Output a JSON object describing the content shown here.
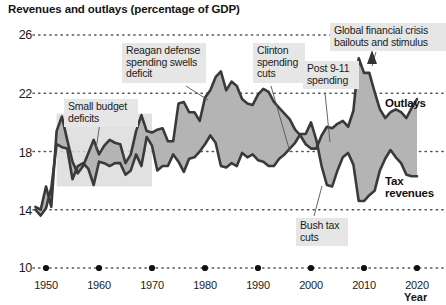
{
  "chart_data": {
    "type": "area",
    "title": "Revenues and outlays (percentage of GDP)",
    "xlabel": "Year",
    "ylabel": "",
    "xlim": [
      1948,
      2021
    ],
    "ylim": [
      10,
      26
    ],
    "grid": true,
    "grid_style": "dotted-horizontal",
    "legend": "inline-right",
    "yticks": [
      "26",
      "22",
      "18",
      "14",
      "10"
    ],
    "ytick_values": [
      26,
      22,
      18,
      14,
      10
    ],
    "xticks": [
      "1950",
      "1960",
      "1970",
      "1980",
      "1990",
      "2000",
      "2010",
      "2020"
    ],
    "xtick_values": [
      1950,
      1960,
      1970,
      1980,
      1990,
      2000,
      2010,
      2020
    ],
    "x": [
      1948,
      1949,
      1950,
      1951,
      1952,
      1953,
      1954,
      1955,
      1956,
      1957,
      1958,
      1959,
      1960,
      1961,
      1962,
      1963,
      1964,
      1965,
      1966,
      1967,
      1968,
      1969,
      1970,
      1971,
      1972,
      1973,
      1974,
      1975,
      1976,
      1977,
      1978,
      1979,
      1980,
      1981,
      1982,
      1983,
      1984,
      1985,
      1986,
      1987,
      1988,
      1989,
      1990,
      1991,
      1992,
      1993,
      1994,
      1995,
      1996,
      1997,
      1998,
      1999,
      2000,
      2001,
      2002,
      2003,
      2004,
      2005,
      2006,
      2007,
      2008,
      2009,
      2010,
      2011,
      2012,
      2013,
      2014,
      2015,
      2016,
      2017,
      2018,
      2019,
      2020
    ],
    "series": [
      {
        "name": "Outlays",
        "color": "#3a3a3a",
        "values": [
          14.2,
          14.0,
          15.6,
          14.2,
          19.4,
          20.4,
          18.8,
          17.3,
          16.5,
          17.0,
          17.9,
          18.8,
          17.8,
          18.4,
          18.8,
          18.6,
          18.5,
          17.2,
          17.8,
          19.4,
          20.5,
          19.4,
          19.3,
          19.5,
          19.6,
          18.7,
          18.7,
          21.3,
          21.4,
          20.7,
          20.7,
          20.1,
          21.7,
          22.2,
          23.1,
          23.5,
          22.2,
          22.8,
          22.5,
          21.6,
          21.3,
          21.2,
          21.9,
          22.3,
          22.1,
          21.4,
          21.0,
          20.6,
          20.2,
          19.5,
          19.1,
          18.5,
          18.2,
          18.2,
          19.1,
          19.7,
          19.6,
          19.9,
          20.1,
          19.7,
          20.8,
          24.4,
          23.4,
          23.4,
          22.1,
          20.9,
          20.3,
          20.7,
          20.9,
          20.7,
          20.3,
          21.0,
          21.6
        ]
      },
      {
        "name": "Tax revenues",
        "color": "#3a3a3a",
        "values": [
          14.0,
          13.6,
          14.1,
          15.5,
          18.5,
          18.3,
          18.2,
          16.1,
          17.0,
          17.2,
          16.8,
          15.7,
          17.3,
          17.2,
          17.0,
          17.2,
          17.2,
          16.4,
          16.7,
          17.8,
          17.0,
          19.0,
          18.4,
          16.7,
          17.0,
          17.0,
          17.8,
          17.3,
          16.6,
          17.5,
          17.6,
          18.0,
          18.5,
          19.1,
          18.6,
          17.0,
          16.9,
          17.2,
          17.0,
          17.9,
          17.6,
          17.8,
          17.4,
          17.3,
          17.0,
          17.0,
          17.5,
          17.8,
          18.2,
          18.6,
          19.2,
          19.2,
          20.0,
          18.8,
          17.0,
          15.7,
          15.6,
          16.7,
          17.6,
          17.9,
          17.1,
          14.6,
          14.6,
          15.0,
          15.3,
          16.7,
          17.5,
          18.1,
          17.6,
          17.2,
          16.4,
          16.3,
          16.3
        ]
      }
    ],
    "annotations": [
      {
        "id": "small-budget-deficits",
        "text_lines": [
          "Small budget",
          "deficits"
        ],
        "points_to_year": 1964,
        "points_to_value": 18.2
      },
      {
        "id": "reagan-defense",
        "text_lines": [
          "Reagan defense",
          "spending swells",
          "deficit"
        ],
        "points_to_year": 1983,
        "points_to_value": 23.5
      },
      {
        "id": "clinton-spending-cuts",
        "text_lines": [
          "Clinton",
          "spending",
          "cuts"
        ],
        "points_to_year": 1999,
        "points_to_value": 18.5
      },
      {
        "id": "post-911-spending",
        "text_lines": [
          "Post 9-11",
          "spending"
        ],
        "points_to_year": 2004,
        "points_to_value": 19.6
      },
      {
        "id": "global-financial-crisis",
        "text_lines": [
          "Global financial crisis",
          "bailouts and stimulus"
        ],
        "points_to_year": 2009,
        "points_to_value": 24.4
      },
      {
        "id": "bush-tax-cuts",
        "text_lines": [
          "Bush tax",
          "cuts"
        ],
        "points_to_year": 2003,
        "points_to_value": 15.7
      }
    ],
    "highlight_box": {
      "from_year": 1952,
      "to_year": 1970,
      "from_value": 15.6,
      "to_value": 20.6
    },
    "fill_color": "#b4b4b4",
    "line_color": "#3a3a3a"
  },
  "labels": {
    "outlays": "Outlays",
    "tax_revenues_line1": "Tax",
    "tax_revenues_line2": "revenues",
    "year_axis": "Year"
  },
  "callouts": {
    "small_budget": {
      "l1": "Small budget",
      "l2": "deficits"
    },
    "reagan": {
      "l1": "Reagan defense",
      "l2": "spending swells",
      "l3": "deficit"
    },
    "clinton": {
      "l1": "Clinton",
      "l2": "spending",
      "l3": "cuts"
    },
    "post911": {
      "l1": "Post 9-11",
      "l2": "spending"
    },
    "gfc": {
      "l1": "Global financial crisis",
      "l2": "bailouts and stimulus"
    },
    "bush": {
      "l1": "Bush tax",
      "l2": "cuts"
    }
  }
}
